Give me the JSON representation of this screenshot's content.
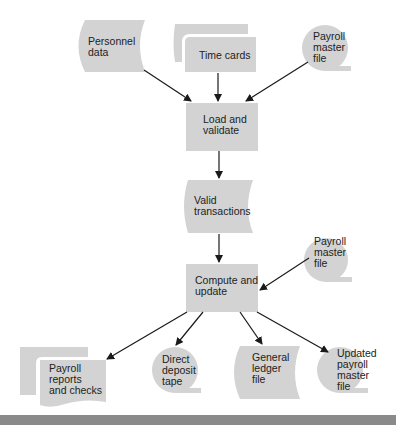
{
  "diagram": {
    "type": "system flowchart",
    "fill_color": "#d3d3d3",
    "arrow_color": "#1a1a1a",
    "nodes": [
      {
        "id": "personnel-data",
        "shape": "stored-data",
        "label": "Personnel\ndata"
      },
      {
        "id": "time-cards",
        "shape": "multi-document",
        "label": "Time cards"
      },
      {
        "id": "payroll-master-in-1",
        "shape": "magnetic-tape",
        "label": "Payroll\nmaster\nfile"
      },
      {
        "id": "load-validate",
        "shape": "process",
        "label": "Load and\nvalidate"
      },
      {
        "id": "valid-transactions",
        "shape": "stored-data",
        "label": "Valid\ntransactions"
      },
      {
        "id": "payroll-master-in-2",
        "shape": "magnetic-tape",
        "label": "Payroll\nmaster\nfile"
      },
      {
        "id": "compute-update",
        "shape": "process",
        "label": "Compute and\nupdate"
      },
      {
        "id": "payroll-reports",
        "shape": "multi-document",
        "label": "Payroll\nreports\nand checks"
      },
      {
        "id": "direct-deposit",
        "shape": "magnetic-tape",
        "label": "Direct\ndeposit\ntape"
      },
      {
        "id": "general-ledger",
        "shape": "stored-data",
        "label": "General\nledger\nfile"
      },
      {
        "id": "updated-master",
        "shape": "magnetic-tape",
        "label": "Updated\npayroll\nmaster\nfile"
      }
    ],
    "edges": [
      {
        "from": "personnel-data",
        "to": "load-validate"
      },
      {
        "from": "time-cards",
        "to": "load-validate"
      },
      {
        "from": "payroll-master-in-1",
        "to": "load-validate"
      },
      {
        "from": "load-validate",
        "to": "valid-transactions"
      },
      {
        "from": "valid-transactions",
        "to": "compute-update"
      },
      {
        "from": "payroll-master-in-2",
        "to": "compute-update"
      },
      {
        "from": "compute-update",
        "to": "payroll-reports"
      },
      {
        "from": "compute-update",
        "to": "direct-deposit"
      },
      {
        "from": "compute-update",
        "to": "general-ledger"
      },
      {
        "from": "compute-update",
        "to": "updated-master"
      }
    ]
  }
}
